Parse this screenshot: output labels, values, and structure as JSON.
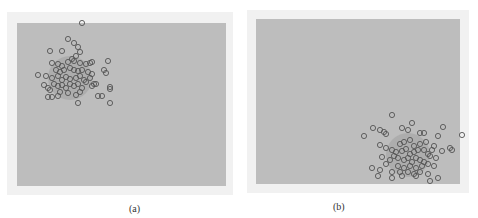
{
  "chart_data": [
    {
      "type": "scatter",
      "title": "",
      "caption": "(a)",
      "xlabel": "",
      "ylabel": "",
      "grid": false,
      "legend": null,
      "description": "Gaussian point cloud concentrated in upper-left of plot area",
      "marker": "hollow circle",
      "cluster_center_px": [
        70,
        78
      ],
      "points_px": [
        [
          82,
          23
        ],
        [
          68,
          39
        ],
        [
          74,
          43
        ],
        [
          50,
          51
        ],
        [
          62,
          51
        ],
        [
          78,
          47
        ],
        [
          80,
          52
        ],
        [
          76,
          56
        ],
        [
          72,
          59
        ],
        [
          92,
          62
        ],
        [
          108,
          61
        ],
        [
          52,
          63
        ],
        [
          58,
          64
        ],
        [
          62,
          66
        ],
        [
          68,
          62
        ],
        [
          74,
          61
        ],
        [
          80,
          63
        ],
        [
          86,
          64
        ],
        [
          90,
          63
        ],
        [
          104,
          70
        ],
        [
          106,
          73
        ],
        [
          38,
          75
        ],
        [
          46,
          76
        ],
        [
          56,
          70
        ],
        [
          60,
          72
        ],
        [
          64,
          70
        ],
        [
          70,
          68
        ],
        [
          74,
          70
        ],
        [
          78,
          71
        ],
        [
          82,
          70
        ],
        [
          88,
          72
        ],
        [
          92,
          74
        ],
        [
          52,
          78
        ],
        [
          58,
          76
        ],
        [
          62,
          80
        ],
        [
          66,
          77
        ],
        [
          70,
          79
        ],
        [
          76,
          78
        ],
        [
          80,
          76
        ],
        [
          84,
          80
        ],
        [
          86,
          82
        ],
        [
          90,
          78
        ],
        [
          94,
          84
        ],
        [
          44,
          85
        ],
        [
          48,
          88
        ],
        [
          54,
          84
        ],
        [
          58,
          86
        ],
        [
          62,
          85
        ],
        [
          66,
          88
        ],
        [
          70,
          84
        ],
        [
          74,
          86
        ],
        [
          78,
          84
        ],
        [
          82,
          88
        ],
        [
          92,
          86
        ],
        [
          96,
          84
        ],
        [
          110,
          87
        ],
        [
          110,
          89
        ],
        [
          50,
          90
        ],
        [
          60,
          92
        ],
        [
          68,
          93
        ],
        [
          76,
          95
        ],
        [
          80,
          92
        ],
        [
          48,
          97
        ],
        [
          52,
          97
        ],
        [
          58,
          96
        ],
        [
          98,
          96
        ],
        [
          102,
          96
        ],
        [
          78,
          103
        ],
        [
          110,
          103
        ]
      ]
    },
    {
      "type": "scatter",
      "title": "",
      "caption": "(b)",
      "xlabel": "",
      "ylabel": "",
      "grid": false,
      "legend": null,
      "description": "Gaussian point cloud concentrated in lower-right of plot area",
      "marker": "hollow circle",
      "cluster_center_px": [
        408,
        155
      ],
      "points_px": [
        [
          392,
          115
        ],
        [
          412,
          123
        ],
        [
          373,
          128
        ],
        [
          380,
          130
        ],
        [
          402,
          128
        ],
        [
          408,
          130
        ],
        [
          443,
          127
        ],
        [
          462,
          135
        ],
        [
          364,
          136
        ],
        [
          384,
          132
        ],
        [
          386,
          134
        ],
        [
          420,
          133
        ],
        [
          424,
          133
        ],
        [
          438,
          136
        ],
        [
          380,
          145
        ],
        [
          386,
          148
        ],
        [
          400,
          144
        ],
        [
          404,
          142
        ],
        [
          410,
          140
        ],
        [
          414,
          146
        ],
        [
          420,
          144
        ],
        [
          426,
          142
        ],
        [
          434,
          146
        ],
        [
          392,
          150
        ],
        [
          396,
          152
        ],
        [
          402,
          151
        ],
        [
          406,
          149
        ],
        [
          410,
          154
        ],
        [
          414,
          152
        ],
        [
          418,
          150
        ],
        [
          424,
          150
        ],
        [
          428,
          154
        ],
        [
          432,
          150
        ],
        [
          442,
          151
        ],
        [
          450,
          148
        ],
        [
          452,
          150
        ],
        [
          382,
          157
        ],
        [
          390,
          160
        ],
        [
          394,
          156
        ],
        [
          398,
          158
        ],
        [
          404,
          160
        ],
        [
          408,
          158
        ],
        [
          412,
          162
        ],
        [
          416,
          158
        ],
        [
          420,
          160
        ],
        [
          424,
          162
        ],
        [
          430,
          156
        ],
        [
          436,
          158
        ],
        [
          386,
          164
        ],
        [
          398,
          166
        ],
        [
          404,
          168
        ],
        [
          410,
          166
        ],
        [
          416,
          168
        ],
        [
          422,
          166
        ],
        [
          428,
          164
        ],
        [
          434,
          166
        ],
        [
          380,
          170
        ],
        [
          392,
          172
        ],
        [
          400,
          172
        ],
        [
          408,
          172
        ],
        [
          414,
          174
        ],
        [
          420,
          172
        ],
        [
          378,
          176
        ],
        [
          392,
          178
        ],
        [
          402,
          176
        ],
        [
          416,
          176
        ],
        [
          428,
          174
        ],
        [
          438,
          178
        ],
        [
          372,
          168
        ],
        [
          430,
          181
        ]
      ]
    }
  ],
  "panels": {
    "a": {
      "caption": "(a)"
    },
    "b": {
      "caption": "(b)"
    }
  },
  "colors": {
    "plot_bg": "#bdbdbd",
    "frame_bg": "#f1f1f1",
    "marker": "#555555"
  }
}
